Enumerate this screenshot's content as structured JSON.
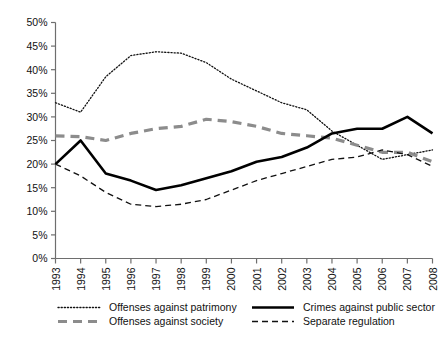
{
  "chart_data": {
    "type": "line",
    "title": "",
    "xlabel": "",
    "ylabel": "",
    "ylim": [
      0,
      50
    ],
    "ytick_labels": [
      "0%",
      "5%",
      "10%",
      "15%",
      "20%",
      "25%",
      "30%",
      "35%",
      "40%",
      "45%",
      "50%"
    ],
    "ytick_values": [
      0,
      5,
      10,
      15,
      20,
      25,
      30,
      35,
      40,
      45,
      50
    ],
    "grid": false,
    "legend_position": "bottom",
    "categories": [
      "1993",
      "1994",
      "1995",
      "1996",
      "1997",
      "1998",
      "1999",
      "2000",
      "2001",
      "2002",
      "2003",
      "2004",
      "2005",
      "2006",
      "2007",
      "2008"
    ],
    "x": [
      "1993",
      "1994",
      "1995",
      "1996",
      "1997",
      "1998",
      "1999",
      "2000",
      "2001",
      "2002",
      "2003",
      "2004",
      "2005",
      "2006",
      "2007",
      "2008"
    ],
    "series": [
      {
        "name": "Offenses against patrimony",
        "style": "dotted",
        "color": "#111111",
        "width": 1.3,
        "values": [
          33.0,
          31.0,
          38.5,
          43.0,
          43.8,
          43.5,
          41.5,
          38.0,
          35.5,
          33.0,
          31.5,
          27.0,
          24.0,
          21.0,
          22.0,
          23.0
        ]
      },
      {
        "name": "Offenses against society",
        "style": "dashed-thick",
        "color": "#8c8c8c",
        "width": 3.2,
        "values": [
          26.0,
          25.8,
          25.0,
          26.5,
          27.5,
          28.0,
          29.5,
          29.0,
          28.0,
          26.5,
          26.0,
          25.5,
          24.0,
          22.5,
          22.5,
          20.5
        ]
      },
      {
        "name": "Crimes against public sector",
        "style": "solid",
        "color": "#000000",
        "width": 2.6,
        "values": [
          20.0,
          25.0,
          18.0,
          16.5,
          14.5,
          15.5,
          17.0,
          18.5,
          20.5,
          21.5,
          23.5,
          26.5,
          27.5,
          27.5,
          30.0,
          26.5
        ]
      },
      {
        "name": "Separate regulation",
        "style": "dashed-thin",
        "color": "#111111",
        "width": 1.3,
        "values": [
          20.0,
          17.5,
          14.0,
          11.5,
          11.0,
          11.5,
          12.5,
          14.5,
          16.5,
          18.0,
          19.5,
          21.0,
          21.5,
          23.0,
          22.0,
          19.5
        ]
      }
    ]
  },
  "legend": {
    "entries": [
      {
        "label": "Offenses against patrimony",
        "style": "dotted",
        "color": "#111111"
      },
      {
        "label": "Offenses against society",
        "style": "dashed-thick",
        "color": "#8c8c8c"
      },
      {
        "label": "Crimes against public sector",
        "style": "solid",
        "color": "#000000"
      },
      {
        "label": "Separate regulation",
        "style": "dashed-thin",
        "color": "#111111"
      }
    ]
  }
}
